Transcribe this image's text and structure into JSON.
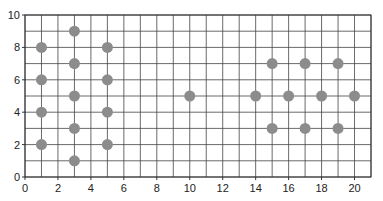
{
  "chart_data": {
    "type": "scatter",
    "title": "",
    "xlabel": "",
    "ylabel": "",
    "xlim": [
      0,
      21
    ],
    "ylim": [
      0,
      10
    ],
    "grid": true,
    "grid_step": 1,
    "legend": null,
    "xticks": [
      0,
      2,
      4,
      6,
      8,
      10,
      12,
      14,
      16,
      18,
      20
    ],
    "yticks": [
      0,
      2,
      4,
      6,
      8,
      10
    ],
    "marker_color": "#8c8c8c",
    "grid_color": "#444444",
    "points": [
      {
        "x": 1,
        "y": 2
      },
      {
        "x": 1,
        "y": 4
      },
      {
        "x": 1,
        "y": 6
      },
      {
        "x": 1,
        "y": 8
      },
      {
        "x": 3,
        "y": 1
      },
      {
        "x": 3,
        "y": 3
      },
      {
        "x": 3,
        "y": 5
      },
      {
        "x": 3,
        "y": 7
      },
      {
        "x": 3,
        "y": 9
      },
      {
        "x": 5,
        "y": 2
      },
      {
        "x": 5,
        "y": 4
      },
      {
        "x": 5,
        "y": 6
      },
      {
        "x": 5,
        "y": 8
      },
      {
        "x": 10,
        "y": 5
      },
      {
        "x": 14,
        "y": 5
      },
      {
        "x": 15,
        "y": 3
      },
      {
        "x": 15,
        "y": 7
      },
      {
        "x": 16,
        "y": 5
      },
      {
        "x": 17,
        "y": 3
      },
      {
        "x": 17,
        "y": 7
      },
      {
        "x": 18,
        "y": 5
      },
      {
        "x": 19,
        "y": 3
      },
      {
        "x": 19,
        "y": 7
      },
      {
        "x": 20,
        "y": 5
      }
    ]
  }
}
